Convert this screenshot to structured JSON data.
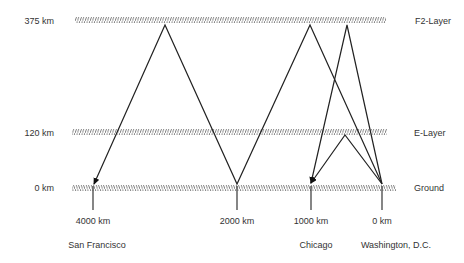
{
  "diagram": {
    "altitude_labels": [
      {
        "label": "375 km",
        "y": 16
      },
      {
        "label": "120 km",
        "y": 128
      },
      {
        "label": "0 km",
        "y": 183
      }
    ],
    "layers": [
      {
        "label": "F2-Layer",
        "x_start": 75,
        "x_end": 386,
        "y": 17,
        "label_x": 415
      },
      {
        "label": "E-Layer",
        "x_start": 72,
        "x_end": 387,
        "y": 129,
        "label_x": 414
      },
      {
        "label": "Ground",
        "x_start": 72,
        "x_end": 396,
        "y": 185,
        "label_x": 414
      }
    ],
    "distance_markers": [
      {
        "label": "4000 km",
        "x": 93
      },
      {
        "label": "2000 km",
        "x": 237
      },
      {
        "label": "1000 km",
        "x": 311
      },
      {
        "label": "0 km",
        "x": 382
      }
    ],
    "cities": [
      {
        "label": "San Francisco",
        "x": 97
      },
      {
        "label": "Chicago",
        "x": 316
      },
      {
        "label": "Washington, D.C.",
        "x": 396
      }
    ],
    "paths": [
      {
        "name": "f2-two-hop-to-san-francisco",
        "points": [
          [
            382,
            184
          ],
          [
            310,
            25
          ],
          [
            237,
            184
          ],
          [
            165,
            25
          ],
          [
            94,
            184
          ]
        ]
      },
      {
        "name": "f2-one-hop-to-chicago",
        "points": [
          [
            382,
            184
          ],
          [
            347,
            25
          ],
          [
            311,
            183
          ]
        ]
      },
      {
        "name": "e-one-hop-to-chicago",
        "points": [
          [
            382,
            184
          ],
          [
            345,
            135
          ],
          [
            311,
            183
          ]
        ]
      }
    ],
    "colors": {
      "line": "#222222",
      "hatch": "#555555",
      "text": "#333333"
    }
  }
}
